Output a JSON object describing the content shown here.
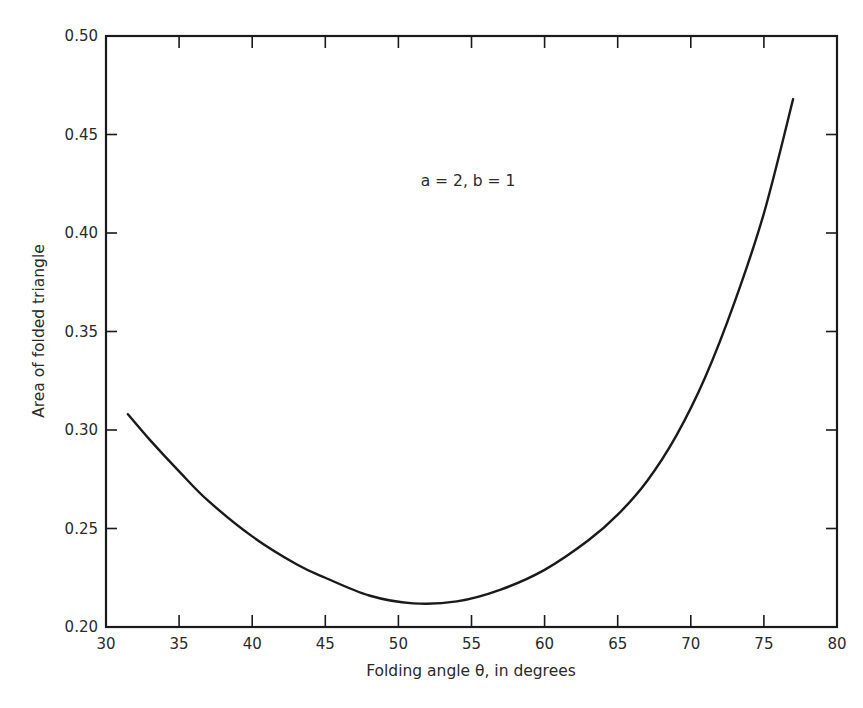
{
  "chart_data": {
    "type": "line",
    "title": "",
    "xlabel": "Folding angle θ, in degrees",
    "ylabel": "Area of  folded triangle",
    "xlim": [
      30,
      80
    ],
    "ylim": [
      0.2,
      0.5
    ],
    "xticks": [
      "30",
      "35",
      "40",
      "45",
      "50",
      "55",
      "60",
      "65",
      "70",
      "75",
      "80"
    ],
    "yticks": [
      "0.20",
      "0.25",
      "0.30",
      "0.35",
      "0.40",
      "0.45",
      "0.50"
    ],
    "grid": false,
    "annotation": "a = 2, b = 1",
    "series": [
      {
        "name": "a = 2, b = 1",
        "x": [
          31.5,
          33,
          35,
          37,
          40,
          43,
          45,
          48,
          51,
          54,
          57,
          60,
          63,
          65,
          67,
          69,
          71,
          73,
          75,
          77
        ],
        "y": [
          0.308,
          0.295,
          0.279,
          0.264,
          0.246,
          0.232,
          0.225,
          0.216,
          0.212,
          0.213,
          0.219,
          0.229,
          0.244,
          0.257,
          0.274,
          0.297,
          0.327,
          0.365,
          0.41,
          0.468
        ]
      }
    ]
  }
}
